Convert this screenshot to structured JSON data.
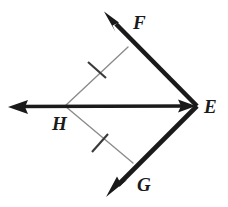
{
  "figure": {
    "background_color": "#ffffff",
    "ray_color": "#1a1a1a",
    "thin_segment_color": "#8c8c8c",
    "label_color": "#1a1a1a",
    "points": {
      "E": {
        "x": 197,
        "y": 106,
        "label": "E"
      },
      "F": {
        "x": 105,
        "y": 12,
        "label": "F"
      },
      "G": {
        "x": 107,
        "y": 197,
        "label": "G"
      },
      "H": {
        "x": 65,
        "y": 106,
        "label": "H"
      }
    },
    "foot_points": {
      "on_EF": {
        "x": 128,
        "y": 47
      },
      "on_EG": {
        "x": 133,
        "y": 163
      }
    },
    "arrow_tips": {
      "toward_F": {
        "x": 105,
        "y": 12
      },
      "toward_G": {
        "x": 107,
        "y": 197
      },
      "toward_left": {
        "x": 8,
        "y": 107
      },
      "toward_E": {
        "x": 196,
        "y": 106
      }
    },
    "rays": [
      {
        "name": "ray-EF",
        "from": "E",
        "to": "F",
        "arrow_at": "F",
        "stroke_width": 5
      },
      {
        "name": "ray-EG",
        "from": "E",
        "to": "G",
        "arrow_at": "G",
        "stroke_width": 5
      },
      {
        "name": "ray-EH",
        "from": "E",
        "to": "left",
        "arrow_at": "both",
        "stroke_width": 4
      }
    ],
    "congruent_segments": [
      {
        "name": "segment-H-to-EF",
        "from": "H",
        "to": "on_EF",
        "tick_count": 1,
        "tick_center": {
          "x": 97,
          "y": 70
        }
      },
      {
        "name": "segment-H-to-EG",
        "from": "H",
        "to": "on_EG",
        "tick_count": 1,
        "tick_center": {
          "x": 100,
          "y": 143
        }
      }
    ],
    "labels": {
      "F": "F",
      "E": "E",
      "H": "H",
      "G": "G"
    }
  }
}
